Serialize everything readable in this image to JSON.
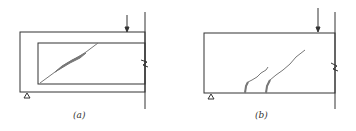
{
  "figure": {
    "panels": [
      {
        "id": "a",
        "caption": "(a)",
        "description": "Beam with inclined diagonal shear crack, load near support"
      },
      {
        "id": "b",
        "caption": "(b)",
        "description": "Deep beam with two flexure-shear cracks starting at bottom edge"
      }
    ],
    "colors": {
      "line": "#333333",
      "crack": "#777777",
      "background": "#ffffff"
    }
  }
}
